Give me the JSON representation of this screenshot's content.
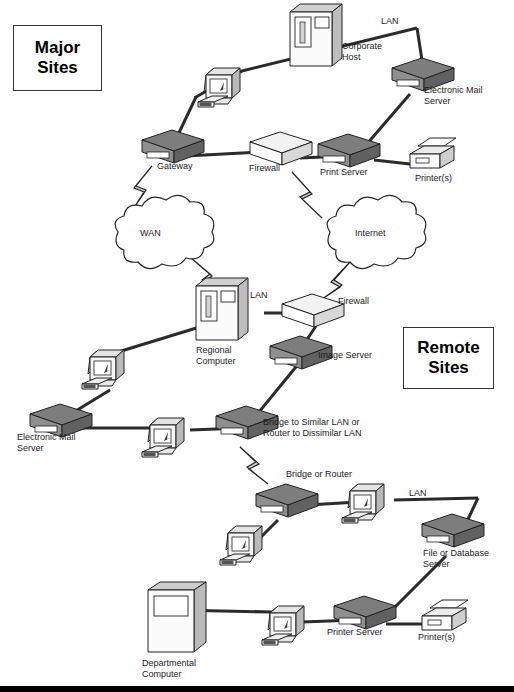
{
  "diagram": {
    "zones": [
      {
        "id": "major-sites",
        "line1": "Major",
        "line2": "Sites",
        "x": 13,
        "y": 25,
        "w": 87,
        "h": 64
      },
      {
        "id": "remote-sites",
        "line1": "Remote",
        "line2": "Sites",
        "x": 403,
        "y": 327,
        "w": 89,
        "h": 60
      }
    ],
    "labels": [
      {
        "id": "lan-top",
        "text": "LAN",
        "x": 381,
        "y": 16,
        "align": "lft"
      },
      {
        "id": "corporate-host",
        "text": "Corporate\nHost",
        "x": 342,
        "y": 41,
        "align": "lft"
      },
      {
        "id": "electronic-mail-server-top",
        "text": "Electronic Mail\nServer",
        "x": 424,
        "y": 85,
        "align": "lft"
      },
      {
        "id": "gateway",
        "text": "Gateway",
        "x": 157,
        "y": 161,
        "align": "lft"
      },
      {
        "id": "firewall-top",
        "text": "Firewall",
        "x": 249,
        "y": 163,
        "align": "lft"
      },
      {
        "id": "print-server",
        "text": "Print Server",
        "x": 320,
        "y": 167,
        "align": "lft"
      },
      {
        "id": "printers-top",
        "text": "Printer(s)",
        "x": 415,
        "y": 173,
        "align": "lft"
      },
      {
        "id": "wan-cloud",
        "text": "WAN",
        "x": 140,
        "y": 228,
        "align": "lft"
      },
      {
        "id": "internet-cloud",
        "text": "Internet",
        "x": 355,
        "y": 228,
        "align": "lft"
      },
      {
        "id": "lan-middle",
        "text": "LAN",
        "x": 250,
        "y": 290,
        "align": "lft"
      },
      {
        "id": "firewall-middle",
        "text": "Firewall",
        "x": 338,
        "y": 296,
        "align": "lft"
      },
      {
        "id": "regional-computer",
        "text": "Regional\nComputer",
        "x": 196,
        "y": 345,
        "align": "lft"
      },
      {
        "id": "image-server",
        "text": "Image Server",
        "x": 318,
        "y": 350,
        "align": "lft"
      },
      {
        "id": "electronic-mail-server-bottom",
        "text": "Electronic Mail\nServer",
        "x": 17,
        "y": 432,
        "align": "lft"
      },
      {
        "id": "bridge-router-note",
        "text": "Bridge to Similar LAN or\nRouter to Dissimilar LAN",
        "x": 263,
        "y": 417,
        "align": "lft"
      },
      {
        "id": "bridge-or-router",
        "text": "Bridge or Router",
        "x": 286,
        "y": 469,
        "align": "lft"
      },
      {
        "id": "lan-bottom",
        "text": "LAN",
        "x": 409,
        "y": 488,
        "align": "lft"
      },
      {
        "id": "file-database-server",
        "text": "File or Database\nServer",
        "x": 423,
        "y": 548,
        "align": "lft"
      },
      {
        "id": "printer-server-bottom",
        "text": "Printer Server",
        "x": 327,
        "y": 627,
        "align": "lft"
      },
      {
        "id": "printers-bottom",
        "text": "Printer(s)",
        "x": 418,
        "y": 632,
        "align": "lft"
      },
      {
        "id": "departmental-computer",
        "text": "Departmental\nComputer",
        "x": 142,
        "y": 658,
        "align": "lft"
      }
    ],
    "nodes": [
      {
        "id": "workstation-major-1",
        "type": "workstation",
        "x": 198,
        "y": 80
      },
      {
        "id": "corporate-host-mainframe",
        "type": "mainframe",
        "x": 312,
        "y": 38
      },
      {
        "id": "electronic-mail-server-major",
        "type": "server",
        "x": 413,
        "y": 70
      },
      {
        "id": "gateway-device",
        "type": "server",
        "x": 165,
        "y": 144
      },
      {
        "id": "firewall-major",
        "type": "firewall",
        "x": 272,
        "y": 146
      },
      {
        "id": "print-server-device",
        "type": "server",
        "x": 344,
        "y": 147
      },
      {
        "id": "printer-major",
        "type": "printer",
        "x": 430,
        "y": 155
      },
      {
        "id": "wan-cloud-shape",
        "type": "cloud",
        "x": 155,
        "y": 233
      },
      {
        "id": "internet-cloud-shape",
        "type": "cloud",
        "x": 371,
        "y": 233
      },
      {
        "id": "regional-computer-mainframe",
        "type": "mainframe",
        "x": 218,
        "y": 305
      },
      {
        "id": "firewall-remote",
        "type": "firewall",
        "x": 305,
        "y": 307
      },
      {
        "id": "image-server-device",
        "type": "server",
        "x": 292,
        "y": 348
      },
      {
        "id": "workstation-remote-1",
        "type": "workstation",
        "x": 103,
        "y": 352
      },
      {
        "id": "electronic-mail-server-remote",
        "type": "server",
        "x": 52,
        "y": 417
      },
      {
        "id": "workstation-remote-2",
        "type": "workstation",
        "x": 162,
        "y": 426
      },
      {
        "id": "bridge-router-device",
        "type": "server",
        "x": 238,
        "y": 418
      },
      {
        "id": "bridge-or-router-device",
        "type": "server",
        "x": 278,
        "y": 497
      },
      {
        "id": "workstation-remote-3",
        "type": "workstation",
        "x": 363,
        "y": 490
      },
      {
        "id": "file-database-server-device",
        "type": "server",
        "x": 443,
        "y": 527
      },
      {
        "id": "workstation-remote-4",
        "type": "workstation",
        "x": 240,
        "y": 530
      },
      {
        "id": "departmental-computer-cabinet",
        "type": "cabinet",
        "x": 175,
        "y": 595
      },
      {
        "id": "workstation-remote-5",
        "type": "workstation",
        "x": 283,
        "y": 612
      },
      {
        "id": "printer-server-remote",
        "type": "server",
        "x": 355,
        "y": 609
      },
      {
        "id": "printer-remote",
        "type": "printer",
        "x": 430,
        "y": 613
      }
    ],
    "links": [
      {
        "id": "link-lan-top",
        "from": "workstation-major-1",
        "to": "electronic-mail-server-major"
      },
      {
        "id": "link-gateway-workstation",
        "from": "gateway-device",
        "to": "workstation-major-1"
      },
      {
        "id": "link-gateway-firewall",
        "from": "gateway-device",
        "to": "firewall-major"
      },
      {
        "id": "link-firewall-printserver",
        "from": "firewall-major",
        "to": "print-server-device"
      },
      {
        "id": "link-printserver-printer",
        "from": "print-server-device",
        "to": "printer-major"
      },
      {
        "id": "link-printserver-mailserver",
        "from": "print-server-device",
        "to": "electronic-mail-server-major"
      },
      {
        "id": "link-gateway-wan",
        "from": "gateway-device",
        "to": "wan-cloud-shape",
        "style": "bolt"
      },
      {
        "id": "link-firewall-internet",
        "from": "firewall-major",
        "to": "internet-cloud-shape",
        "style": "bolt"
      },
      {
        "id": "link-wan-regional",
        "from": "wan-cloud-shape",
        "to": "regional-computer-mainframe",
        "style": "bolt"
      },
      {
        "id": "link-internet-firewall-remote",
        "from": "internet-cloud-shape",
        "to": "firewall-remote",
        "style": "bolt"
      },
      {
        "id": "link-regional-firewall",
        "from": "regional-computer-mainframe",
        "to": "firewall-remote"
      },
      {
        "id": "link-firewall-imageserver",
        "from": "firewall-remote",
        "to": "image-server-device"
      },
      {
        "id": "link-imageserver-bridge",
        "from": "image-server-device",
        "to": "bridge-router-device"
      },
      {
        "id": "link-regional-workstation",
        "from": "regional-computer-mainframe",
        "to": "workstation-remote-1"
      },
      {
        "id": "link-workstation-mailserver",
        "from": "workstation-remote-1",
        "to": "electronic-mail-server-remote"
      },
      {
        "id": "link-mailserver-bridge",
        "from": "electronic-mail-server-remote",
        "to": "bridge-router-device"
      },
      {
        "id": "link-bridge-bolt",
        "from": "bridge-router-device",
        "to": "bridge-or-router-device",
        "style": "bolt"
      },
      {
        "id": "link-bridge-workstation3",
        "from": "bridge-or-router-device",
        "to": "workstation-remote-3"
      },
      {
        "id": "link-workstation3-lan",
        "from": "workstation-remote-3",
        "to": "file-database-server-device"
      },
      {
        "id": "link-bridge-workstation4",
        "from": "bridge-or-router-device",
        "to": "workstation-remote-4"
      },
      {
        "id": "link-fileserver-printerserver",
        "from": "file-database-server-device",
        "to": "printer-server-remote"
      },
      {
        "id": "link-departmental-bus",
        "from": "departmental-computer-cabinet",
        "to": "printer-remote"
      }
    ]
  },
  "colors": {
    "line": "#2b2b2b",
    "server_top": "#777777",
    "server_face": "#8d8d8d",
    "server_side": "#5a5a5a",
    "light_face": "#ffffff",
    "light_top": "#ebebeb",
    "light_side": "#c9c9c9",
    "text": "#1a1a1a",
    "bottom_bar": "#000000"
  }
}
